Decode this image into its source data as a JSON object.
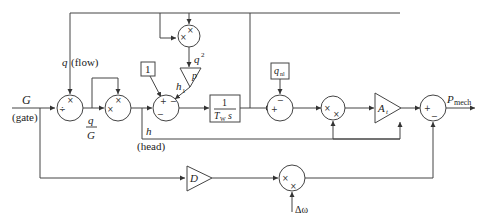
{
  "diagram": {
    "type": "block-diagram",
    "inputs": {
      "gate": {
        "symbol": "G",
        "label": "(gate)"
      },
      "speed_deviation": {
        "symbol": "Δω"
      }
    },
    "output": {
      "symbol": "P",
      "subscript": "mech"
    },
    "signals": {
      "flow": {
        "symbol": "q",
        "label": "(flow)"
      },
      "q_over_G_num": "q",
      "q_over_G_den": "G",
      "head": {
        "symbol": "h",
        "label": "(head)"
      },
      "q_squared": {
        "symbol": "q",
        "superscript": "2"
      },
      "h1": {
        "symbol": "h",
        "subscript": "1"
      }
    },
    "blocks": {
      "const_one": "1",
      "friction_gain": "p",
      "integrator_num": "1",
      "integrator_den_sym": "T",
      "integrator_den_sub": "W",
      "integrator_den_s": "s",
      "no_load_flow": {
        "symbol": "q",
        "subscript": "nl"
      },
      "turbine_gain": {
        "symbol": "A",
        "subscript": "t"
      },
      "damping_gain": "D"
    },
    "signs": {
      "divide_junction": [
        "×",
        "÷"
      ],
      "square_junction_top": [
        "×",
        "×"
      ],
      "multiply_junction": [
        "×",
        "×"
      ],
      "sum_head": [
        "+",
        "−",
        "−"
      ],
      "sum_flow": [
        "+",
        "−"
      ],
      "mult_power": [
        "×",
        "×"
      ],
      "sum_output": [
        "+",
        "−"
      ],
      "mult_damping": [
        "×",
        "×"
      ]
    }
  }
}
